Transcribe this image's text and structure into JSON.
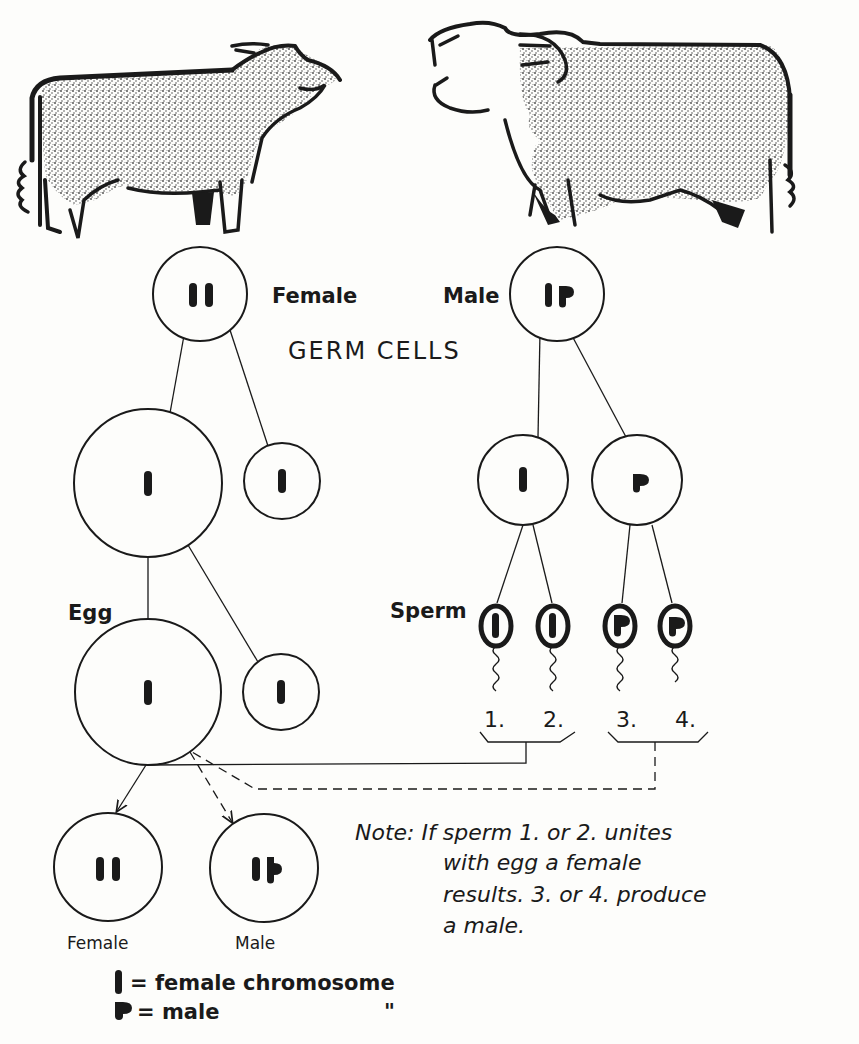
{
  "title": "GERM CELLS",
  "parents": {
    "female": {
      "label": "Female",
      "chromosomes": "XX"
    },
    "male": {
      "label": "Male",
      "chromosomes": "XY"
    }
  },
  "labels": {
    "egg": "Egg",
    "sperm": "Sperm"
  },
  "sperm_numbers": [
    "1.",
    "2.",
    "3.",
    "4."
  ],
  "offspring": [
    {
      "label": "Female",
      "chromosomes": "XX"
    },
    {
      "label": "Male",
      "chromosomes": "XY"
    }
  ],
  "note": {
    "lines": [
      "Note: If  sperm  1.  or  2.  unites",
      "with  egg  a  female",
      "results.  3.  or  4.  produce",
      "a  male."
    ]
  },
  "legend": [
    {
      "symbol": "female-chromosome",
      "text": "=  female    chromosome"
    },
    {
      "symbol": "male-chromosome",
      "text": "=  male",
      "ditto": "\""
    }
  ],
  "colors": {
    "ink": "#1a1a1a",
    "paper": "#fdfdfb",
    "stipple": "#555555"
  }
}
